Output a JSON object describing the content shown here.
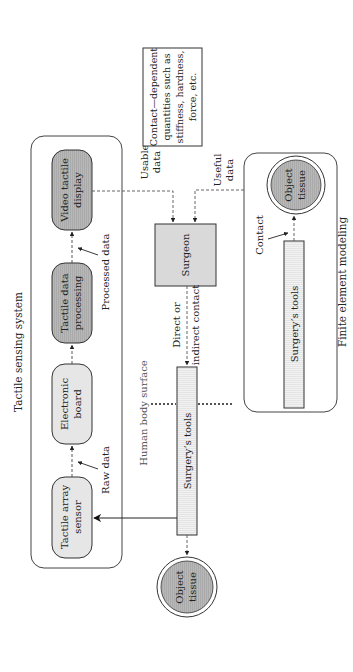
{
  "diagram": {
    "orientation": "rotated-90-ccw",
    "groups": {
      "tactile_sensing": {
        "title": "Tactile sensing system",
        "nodes": {
          "sensor": [
            "Tactile array",
            "sensor"
          ],
          "board": [
            "Electronic",
            "board"
          ],
          "processing": [
            "Tactile data",
            "processing"
          ],
          "display": [
            "Video tactile",
            "display"
          ]
        },
        "edge_labels": {
          "raw": "Raw data",
          "processed": "Processed data"
        }
      },
      "fem": {
        "title": "Finite element modeling",
        "tools": "Surgery’s tools",
        "tissue": [
          "Object",
          "tissue"
        ],
        "contact": "Contact"
      }
    },
    "surgeon": "Surgeon",
    "tools": "Surgery’s tools",
    "tissue": [
      "Object",
      "tissue"
    ],
    "human_body_surface": "Human body surface",
    "edge_labels": {
      "usable": [
        "Usable",
        "data"
      ],
      "useful": [
        "Useful",
        "data"
      ],
      "contact": [
        "Direct or",
        "indirect contact"
      ]
    },
    "note": [
      "Contact—dependent",
      "quantities such as",
      "stiffness, hardness,",
      "force, etc."
    ],
    "colors": {
      "light_box": "#e6e6e6",
      "dark_box": "#b3b3b3",
      "tissue": "#a8a8a8",
      "stroke": "#333333",
      "dotted": "#666666"
    }
  }
}
